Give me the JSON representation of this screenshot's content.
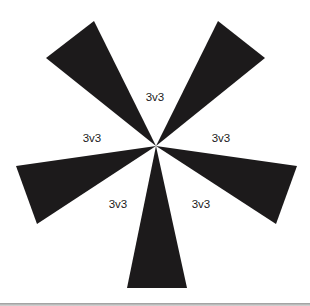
{
  "diagram": {
    "center": [
      156,
      146
    ],
    "blade_color": "#1c1a1b",
    "background": "#ffffff",
    "blades": [
      {
        "name": "top-left",
        "points": [
          [
            156,
            146
          ],
          [
            94,
            21
          ],
          [
            46,
            58
          ]
        ]
      },
      {
        "name": "top-right",
        "points": [
          [
            156,
            146
          ],
          [
            218,
            21
          ],
          [
            265,
            58
          ]
        ]
      },
      {
        "name": "left",
        "points": [
          [
            156,
            146
          ],
          [
            16,
            166
          ],
          [
            37,
            224
          ]
        ]
      },
      {
        "name": "right",
        "points": [
          [
            156,
            146
          ],
          [
            297,
            166
          ],
          [
            276,
            224
          ]
        ]
      },
      {
        "name": "bottom",
        "points": [
          [
            156,
            146
          ],
          [
            127,
            288
          ],
          [
            187,
            288
          ]
        ]
      }
    ],
    "labels": [
      {
        "text": "3v3",
        "x": 155,
        "y": 101
      },
      {
        "text": "3v3",
        "x": 92,
        "y": 142
      },
      {
        "text": "3v3",
        "x": 221,
        "y": 142
      },
      {
        "text": "3v3",
        "x": 118,
        "y": 208
      },
      {
        "text": "3v3",
        "x": 201,
        "y": 208
      }
    ]
  }
}
